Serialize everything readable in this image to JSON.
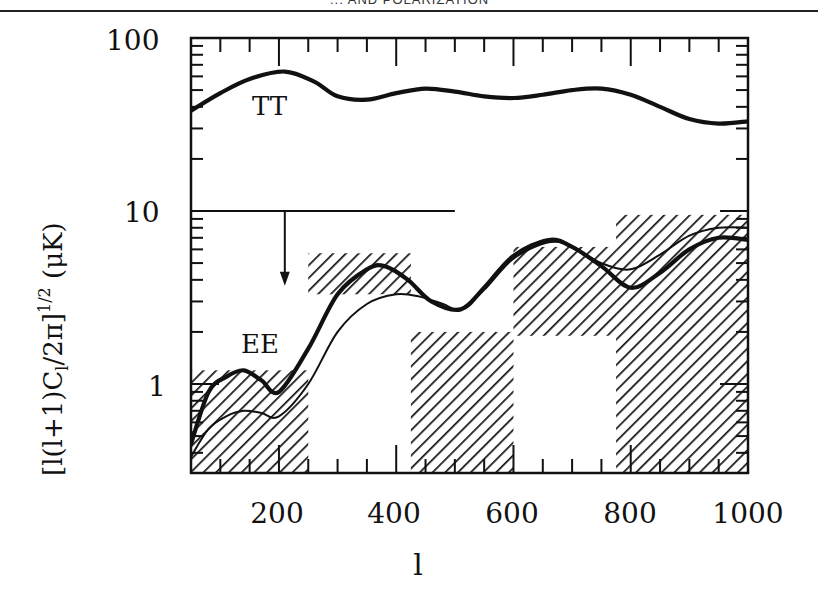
{
  "header": {
    "running_title": "... AND POLARIZATION"
  },
  "chart_data": {
    "type": "line",
    "title": "",
    "xlabel": "l",
    "ylabel": "[l(l+1)C_l/2π]^{1/2} (μK)",
    "xlim": [
      50,
      1000
    ],
    "ylim": [
      0.31,
      100
    ],
    "yscale": "log",
    "grid": false,
    "legend": "inline labels",
    "x_ticks": [
      200,
      400,
      600,
      800,
      1000
    ],
    "y_ticks": [
      1,
      10,
      100
    ],
    "x_tick_labels": [
      "200",
      "400",
      "600",
      "800",
      "1000"
    ],
    "y_tick_labels": [
      "1",
      "10",
      "100"
    ],
    "series": [
      {
        "name": "TT",
        "style": "thick",
        "x": [
          50,
          100,
          150,
          210,
          260,
          300,
          350,
          400,
          450,
          500,
          550,
          600,
          650,
          700,
          750,
          800,
          850,
          900,
          950,
          1000
        ],
        "y": [
          38,
          48,
          58,
          64,
          56,
          46,
          44,
          48,
          51,
          49,
          46,
          45,
          47,
          50,
          51,
          47,
          40,
          34,
          32,
          33
        ]
      },
      {
        "name": "EE (model 1)",
        "style": "thick",
        "x": [
          50,
          80,
          110,
          140,
          170,
          200,
          250,
          300,
          350,
          380,
          420,
          460,
          510,
          550,
          600,
          660,
          700,
          750,
          800,
          850,
          900,
          950,
          1000
        ],
        "y": [
          0.45,
          0.9,
          1.1,
          1.2,
          1.05,
          0.9,
          1.6,
          3.3,
          4.6,
          4.8,
          4.0,
          3.0,
          2.7,
          3.6,
          5.5,
          6.8,
          6.2,
          4.8,
          3.6,
          4.4,
          6.0,
          7.0,
          6.8
        ]
      },
      {
        "name": "EE (model 2)",
        "style": "thin",
        "x": [
          50,
          80,
          110,
          140,
          170,
          200,
          250,
          300,
          350,
          400,
          440,
          480,
          510,
          550,
          600,
          660,
          700,
          750,
          800,
          850,
          900,
          950,
          1000
        ],
        "y": [
          0.38,
          0.55,
          0.65,
          0.7,
          0.68,
          0.65,
          1.0,
          2.0,
          2.9,
          3.3,
          3.2,
          2.9,
          2.7,
          3.5,
          5.3,
          6.6,
          6.2,
          5.0,
          4.6,
          5.6,
          7.2,
          8.0,
          8.0
        ]
      }
    ],
    "upper_limit": {
      "x_range": [
        50,
        500
      ],
      "y": 10,
      "arrow_x": 210,
      "arrow_to_y": 3.7
    },
    "hatched_boxes": [
      {
        "l_min": 50,
        "l_max": 250,
        "y_min": 0.31,
        "y_max": 1.2
      },
      {
        "l_min": 250,
        "l_max": 425,
        "y_min": 3.3,
        "y_max": 5.7
      },
      {
        "l_min": 425,
        "l_max": 600,
        "y_min": 0.31,
        "y_max": 2.0
      },
      {
        "l_min": 600,
        "l_max": 775,
        "y_min": 1.9,
        "y_max": 6.2
      },
      {
        "l_min": 775,
        "l_max": 1000,
        "y_min": 0.31,
        "y_max": 9.5
      }
    ],
    "annotations": [
      "TT",
      "EE"
    ]
  },
  "labels": {
    "tt": "TT",
    "ee": "EE",
    "xlabel": "l",
    "ylabel": "[l(l+1)C",
    "ylabel_sub": "l",
    "ylabel_mid": "/2π]",
    "ylabel_sup": "1/2",
    "ylabel_unit": " (μK)",
    "x_ticks": [
      "200",
      "400",
      "600",
      "800",
      "1000"
    ],
    "y_ticks": [
      "100",
      "10",
      "1"
    ]
  }
}
